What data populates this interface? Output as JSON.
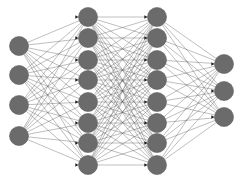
{
  "diagram": {
    "type": "neural-network",
    "width": 241,
    "height": 184,
    "colors": {
      "background": "#ffffff",
      "node_fill": "#6b6b6b",
      "node_stroke": "#5a5a5a",
      "edge": "#555555",
      "arrowhead": "#222222"
    },
    "node_radius": 9.5,
    "layers": [
      {
        "name": "input",
        "x": 19,
        "y": [
          46,
          75,
          105,
          136
        ]
      },
      {
        "name": "hidden-1",
        "x": 88,
        "y": [
          17,
          38,
          60,
          80,
          102,
          123,
          143,
          165
        ]
      },
      {
        "name": "hidden-2",
        "x": 157,
        "y": [
          17,
          38,
          60,
          80,
          102,
          123,
          143,
          165
        ]
      },
      {
        "name": "output",
        "x": 224,
        "y": [
          64,
          91,
          117
        ]
      }
    ],
    "connections": "fully-connected"
  }
}
